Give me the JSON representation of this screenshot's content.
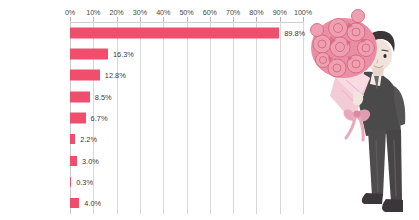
{
  "chart_data": {
    "type": "bar",
    "orientation": "horizontal",
    "title": "",
    "xlabel": "",
    "ylabel": "",
    "xlim": [
      0,
      100
    ],
    "grid": true,
    "legend": false,
    "unit": "%",
    "xticks": [
      "0%",
      "10%",
      "20%",
      "30%",
      "40%",
      "50%",
      "60%",
      "70%",
      "80%",
      "90%",
      "100%"
    ],
    "xtick_values": [
      0,
      10,
      20,
      30,
      40,
      50,
      60,
      70,
      80,
      90,
      100
    ],
    "categories": [
      "直接",
      "電話",
      "手紙",
      "メール",
      "SNS(LINE含む)",
      "メッセンジャーアプリ\n(LINE除く)",
      "人づて",
      "その他",
      "されて嬉しいと思う\n告白はない"
    ],
    "values": [
      89.8,
      16.3,
      12.8,
      8.5,
      6.7,
      2.2,
      3.0,
      0.3,
      4.0
    ],
    "value_labels": [
      "89.8%",
      "16.3%",
      "12.8%",
      "8.5%",
      "6.7%",
      "2.2%",
      "3.0%",
      "0.3%",
      "4.0%"
    ],
    "bar_color": "#ef4f6c",
    "grid_color": "#d8d8d8",
    "text_color": "#3b3b3b"
  },
  "illustration": {
    "name": "man-holding-rose-bouquet",
    "description": "手に大きなバラの花束を持ったスーツ姿の男性のイラスト",
    "colors": {
      "rose": "#eb8fa4",
      "rose_dark": "#d4697f",
      "wrap": "#f2c6d1",
      "suit": "#4b4a4a",
      "skin": "#efe3db",
      "hair": "#3a3537",
      "ribbon": "#e9a9bb",
      "shoe": "#3b3639"
    }
  }
}
